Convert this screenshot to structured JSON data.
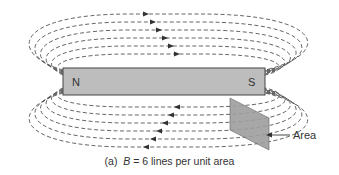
{
  "diagram": {
    "magnet": {
      "north_label": "N",
      "south_label": "S",
      "fill": "#bdbdbd",
      "stroke": "#444444"
    },
    "field_lines": {
      "count_above": 6,
      "count_below": 6,
      "direction_above": "left-to-right",
      "direction_below": "right-to-left",
      "style": "dashed",
      "color": "#555555"
    },
    "area_plate": {
      "label": "Area",
      "fill": "#9e9e9e"
    },
    "caption": {
      "prefix": "(a)",
      "symbol": "B",
      "text": "= 6 lines per unit area"
    }
  }
}
